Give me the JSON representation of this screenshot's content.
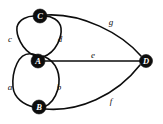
{
  "diagram": {
    "background_color": "#ffffff",
    "node_fill_color": "#0d0d0d",
    "node_text_color": "#ffffff",
    "edge_color": "#0d0d0d",
    "label_color": "#111111",
    "nodes": [
      {
        "id": "C",
        "label": "C",
        "x": 40,
        "y": 16,
        "r": 7
      },
      {
        "id": "A",
        "label": "A",
        "x": 38,
        "y": 61,
        "r": 7
      },
      {
        "id": "B",
        "label": "B",
        "x": 39,
        "y": 107,
        "r": 7
      },
      {
        "id": "D",
        "label": "D",
        "x": 146,
        "y": 61,
        "r": 6.5
      }
    ],
    "edges": [
      {
        "id": "a",
        "label": "a",
        "from": "A",
        "to": "B",
        "shape": "curve-left",
        "label_x": 10,
        "label_y": 87
      },
      {
        "id": "b",
        "label": "b",
        "from": "A",
        "to": "B",
        "shape": "curve-right",
        "label_x": 59,
        "label_y": 87
      },
      {
        "id": "c",
        "label": "c",
        "from": "A",
        "to": "C",
        "shape": "curve-left",
        "label_x": 10,
        "label_y": 39
      },
      {
        "id": "d",
        "label": "d",
        "from": "A",
        "to": "C",
        "shape": "curve-right",
        "label_x": 60,
        "label_y": 39
      },
      {
        "id": "e",
        "label": "e",
        "from": "A",
        "to": "D",
        "shape": "straight",
        "label_x": 93,
        "label_y": 55
      },
      {
        "id": "f",
        "label": "f",
        "from": "B",
        "to": "D",
        "shape": "curve-down",
        "label_x": 111,
        "label_y": 101
      },
      {
        "id": "g",
        "label": "g",
        "from": "C",
        "to": "D",
        "shape": "curve-up",
        "label_x": 111,
        "label_y": 22
      }
    ],
    "edge_paths": {
      "a": "M 36,55 C 17,48 12,74 13,87 C 14,98 24,105 34,107",
      "b": "M 43,56 C 58,62 61,76 58,89 C 55,99 49,105 44,107",
      "c": "M 35,56 C 21,50 16,34 17,27 C 19,19 28,16 34,16",
      "d": "M 43,57 C 57,52 62,36 61,28 C 60,20 51,16 45,16",
      "e": "M 45,61 L 140,61",
      "f": "M 45,109 C 78,112 116,96 140,65",
      "g": "M 46,15 C 82,13 121,33 141,56"
    }
  }
}
